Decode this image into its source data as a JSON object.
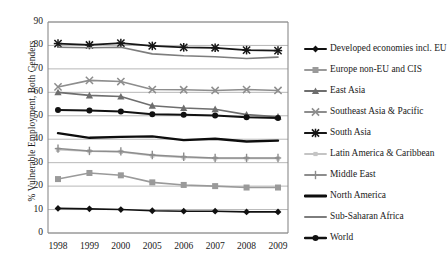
{
  "chart_data": {
    "type": "line",
    "title": "",
    "xlabel": "",
    "ylabel": "% Vulnerable Employment, Both Genders",
    "categories": [
      "1998",
      "1999",
      "2000",
      "2005",
      "2006",
      "2007",
      "2008",
      "2009"
    ],
    "ylim": [
      0,
      90
    ],
    "ytick_step": 10,
    "yticks": [
      "90",
      "80",
      "70",
      "60",
      "50",
      "40",
      "30",
      "20",
      "10",
      "0"
    ],
    "grid": "horizontal",
    "legend_position": "right",
    "series": [
      {
        "name": "Developed economies incl. EU",
        "color": "#111111",
        "marker": "diamond",
        "line_width": 1.6,
        "values": [
          10.5,
          10.3,
          10.0,
          9.5,
          9.3,
          9.3,
          9.0,
          9.0
        ]
      },
      {
        "name": "Europe non-EU and CIS",
        "color": "#9a9a9a",
        "marker": "square",
        "line_width": 1.6,
        "values": [
          23.0,
          25.6,
          24.6,
          21.6,
          20.5,
          20.0,
          19.4,
          19.4
        ]
      },
      {
        "name": "East Asia",
        "color": "#6e6e6e",
        "marker": "triangle",
        "line_width": 1.6,
        "values": [
          60.0,
          58.7,
          58.2,
          54.3,
          53.3,
          52.8,
          50.5,
          49.6
        ]
      },
      {
        "name": "Southeast Asia & Pacific",
        "color": "#8d8d8d",
        "marker": "cross-x",
        "line_width": 1.6,
        "values": [
          62.3,
          65.1,
          64.6,
          61.2,
          61.1,
          60.8,
          61.2,
          60.8
        ]
      },
      {
        "name": "South Asia",
        "color": "#161616",
        "marker": "asterisk",
        "line_width": 1.8,
        "values": [
          80.8,
          80.2,
          81.0,
          79.8,
          79.2,
          79.0,
          78.0,
          77.8
        ]
      },
      {
        "name": "Latin America & Caribbean",
        "color": "#c4c4c4",
        "marker": "small-square",
        "line_width": 1.5,
        "values": [
          35.5,
          34.9,
          34.6,
          33.0,
          32.2,
          31.8,
          31.8,
          31.8
        ]
      },
      {
        "name": "Middle East",
        "color": "#8d8d8d",
        "marker": "plus",
        "line_width": 1.5,
        "values": [
          36.0,
          35.0,
          34.8,
          33.3,
          32.5,
          32.0,
          32.0,
          32.0
        ]
      },
      {
        "name": "North America",
        "color": "#0d0d0d",
        "marker": "none",
        "line_width": 2.4,
        "values": [
          42.6,
          40.6,
          41.0,
          41.2,
          39.6,
          40.2,
          39.0,
          39.4
        ]
      },
      {
        "name": "Sub-Saharan Africa",
        "color": "#7d7d7d",
        "marker": "none",
        "line_width": 1.6,
        "values": [
          79.2,
          79.0,
          79.2,
          76.4,
          75.6,
          75.2,
          74.4,
          75.0
        ]
      },
      {
        "name": "World",
        "color": "#111111",
        "marker": "circle",
        "line_width": 2.0,
        "values": [
          52.5,
          52.3,
          51.8,
          50.7,
          50.4,
          50.1,
          49.4,
          49.0
        ]
      }
    ]
  },
  "axes": {
    "gridline_color": "#b0b0b0",
    "frame_color": "#8a8a8a"
  }
}
